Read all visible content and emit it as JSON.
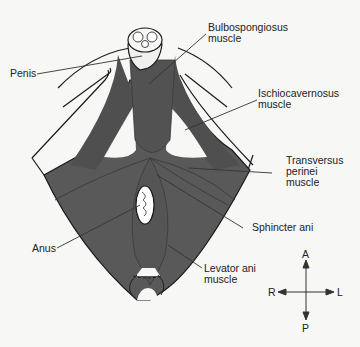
{
  "figure": {
    "type": "anatomical-diagram",
    "colors": {
      "muscle": "#595959",
      "muscle_dark": "#3d3d3d",
      "background": "#f7f7f5",
      "outline": "#1a1a1a",
      "leader": "#333333"
    }
  },
  "labels": {
    "penis": "Penis",
    "bulbospongiosus": [
      "Bulbospongiosus",
      "muscle"
    ],
    "ischiocavernosus": [
      "Ischiocavernosus",
      "muscle"
    ],
    "transversus": [
      "Transversus",
      "perinei",
      "muscle"
    ],
    "sphincter": "Sphincter ani",
    "anus": "Anus",
    "levator": [
      "Levator ani",
      "muscle"
    ]
  },
  "compass": {
    "anterior": "A",
    "posterior": "P",
    "right": "R",
    "left": "L"
  }
}
